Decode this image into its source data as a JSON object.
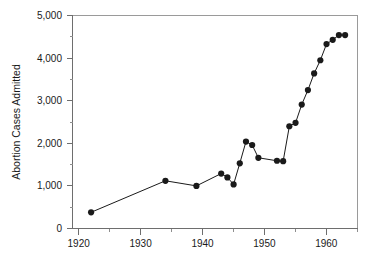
{
  "chart_data": {
    "type": "line",
    "title": "",
    "subtitle": "",
    "xlabel": "",
    "ylabel": "Abortion Cases Admitted",
    "xlim": [
      1919,
      1965
    ],
    "ylim": [
      0,
      5000
    ],
    "grid": false,
    "legend": null,
    "legend_position": "none",
    "marker": "filled-circle",
    "marker_color": "#1a1a1a",
    "line_color": "#1a1a1a",
    "x_major_ticks": [
      1920,
      1930,
      1940,
      1950,
      1960
    ],
    "x_major_tick_labels": [
      "1920",
      "1930",
      "1940",
      "1950",
      "1960"
    ],
    "x_minor_ticks": [
      1925,
      1935,
      1945,
      1955,
      1965
    ],
    "y_major_ticks": [
      0,
      1000,
      2000,
      3000,
      4000,
      5000
    ],
    "y_major_tick_labels": [
      "0",
      "1,000",
      "2,000",
      "3,000",
      "4,000",
      "5,000"
    ],
    "y_minor_ticks": [
      500,
      1500,
      2500,
      3500,
      4500
    ],
    "x": [
      1922,
      1934,
      1939,
      1943,
      1944,
      1945,
      1946,
      1947,
      1948,
      1949,
      1952,
      1953,
      1954,
      1955,
      1956,
      1957,
      1958,
      1959,
      1960,
      1961,
      1962,
      1963
    ],
    "values": [
      380,
      1120,
      1000,
      1290,
      1200,
      1035,
      1530,
      2040,
      1960,
      1660,
      1590,
      1580,
      2400,
      2480,
      2910,
      3250,
      3640,
      3950,
      4330,
      4430,
      4540,
      4540
    ],
    "series": [
      {
        "name": "Abortion Cases Admitted",
        "points": [
          {
            "x": 1922,
            "y": 380
          },
          {
            "x": 1934,
            "y": 1120
          },
          {
            "x": 1939,
            "y": 1000
          },
          {
            "x": 1943,
            "y": 1290
          },
          {
            "x": 1944,
            "y": 1200
          },
          {
            "x": 1945,
            "y": 1035
          },
          {
            "x": 1946,
            "y": 1530
          },
          {
            "x": 1947,
            "y": 2040
          },
          {
            "x": 1948,
            "y": 1960
          },
          {
            "x": 1949,
            "y": 1660
          },
          {
            "x": 1952,
            "y": 1590
          },
          {
            "x": 1953,
            "y": 1580
          },
          {
            "x": 1954,
            "y": 2400
          },
          {
            "x": 1955,
            "y": 2480
          },
          {
            "x": 1956,
            "y": 2910
          },
          {
            "x": 1957,
            "y": 3250
          },
          {
            "x": 1958,
            "y": 3640
          },
          {
            "x": 1959,
            "y": 3950
          },
          {
            "x": 1960,
            "y": 4330
          },
          {
            "x": 1961,
            "y": 4430
          },
          {
            "x": 1962,
            "y": 4540
          },
          {
            "x": 1963,
            "y": 4540
          }
        ]
      }
    ]
  }
}
